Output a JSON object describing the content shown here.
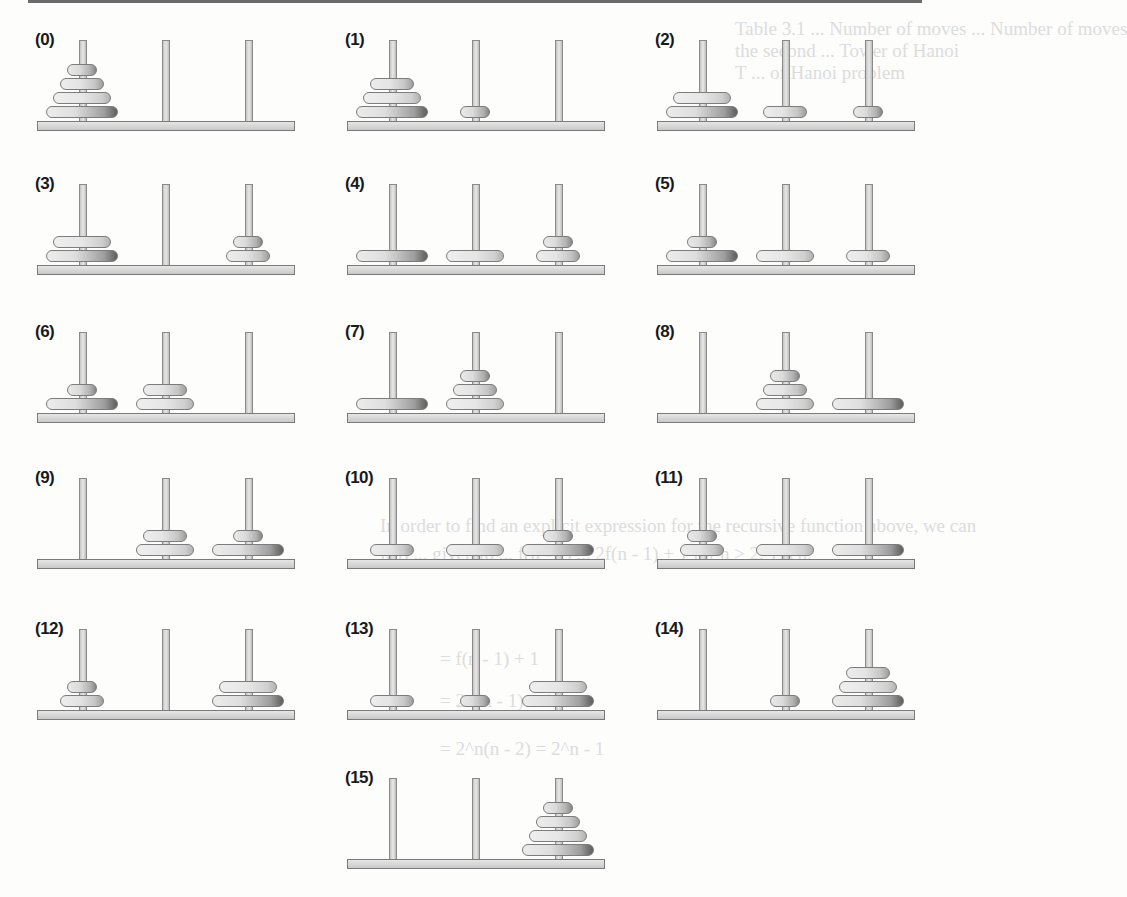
{
  "figure": {
    "pegs": [
      "A",
      "B",
      "C"
    ],
    "disk_sizes": [
      1,
      2,
      3,
      4
    ],
    "panels": [
      {
        "label": "(0)",
        "pegs": [
          [
            4,
            3,
            2,
            1
          ],
          [],
          []
        ]
      },
      {
        "label": "(1)",
        "pegs": [
          [
            4,
            3,
            2
          ],
          [
            1
          ],
          []
        ]
      },
      {
        "label": "(2)",
        "pegs": [
          [
            4,
            3
          ],
          [
            2
          ],
          [
            1
          ]
        ]
      },
      {
        "label": "(3)",
        "pegs": [
          [
            4,
            3
          ],
          [],
          [
            2,
            1
          ]
        ]
      },
      {
        "label": "(4)",
        "pegs": [
          [
            4
          ],
          [
            3
          ],
          [
            2,
            1
          ]
        ]
      },
      {
        "label": "(5)",
        "pegs": [
          [
            4,
            1
          ],
          [
            3
          ],
          [
            2
          ]
        ]
      },
      {
        "label": "(6)",
        "pegs": [
          [
            4,
            1
          ],
          [
            3,
            2
          ],
          []
        ]
      },
      {
        "label": "(7)",
        "pegs": [
          [
            4
          ],
          [
            3,
            2,
            1
          ],
          []
        ]
      },
      {
        "label": "(8)",
        "pegs": [
          [],
          [
            3,
            2,
            1
          ],
          [
            4
          ]
        ]
      },
      {
        "label": "(9)",
        "pegs": [
          [],
          [
            3,
            2
          ],
          [
            4,
            1
          ]
        ]
      },
      {
        "label": "(10)",
        "pegs": [
          [
            2
          ],
          [
            3
          ],
          [
            4,
            1
          ]
        ]
      },
      {
        "label": "(11)",
        "pegs": [
          [
            2,
            1
          ],
          [
            3
          ],
          [
            4
          ]
        ]
      },
      {
        "label": "(12)",
        "pegs": [
          [
            2,
            1
          ],
          [],
          [
            4,
            3
          ]
        ]
      },
      {
        "label": "(13)",
        "pegs": [
          [
            2
          ],
          [
            1
          ],
          [
            4,
            3
          ]
        ]
      },
      {
        "label": "(14)",
        "pegs": [
          [],
          [
            1
          ],
          [
            4,
            3,
            2
          ]
        ]
      },
      {
        "label": "(15)",
        "pegs": [
          [],
          [],
          [
            4,
            3,
            2,
            1
          ]
        ]
      }
    ]
  },
  "bleed_through": {
    "lines": [
      {
        "text": "Table 3.1  ...  Number of moves  ...  Number of moves",
        "x": 735,
        "y": 18
      },
      {
        "text": "the second  ...  Tower of Hanoi",
        "x": 735,
        "y": 40
      },
      {
        "text": "T ... of Hanoi problem",
        "x": 735,
        "y": 62
      },
      {
        "text": "In order to find an explicit expression for the recursive function above, we can",
        "x": 380,
        "y": 515
      },
      {
        "text": "f(n) ... given to ... f(n - 1) ... 2f(n - 1) + 1 for n ≥ 2. Then,",
        "x": 380,
        "y": 543
      },
      {
        "text": "= f(n - 1) + 1",
        "x": 440,
        "y": 648
      },
      {
        "text": "= 2 f(n - 1) + 1",
        "x": 440,
        "y": 690
      },
      {
        "text": "= 2^n(n - 2) = 2^n - 1",
        "x": 440,
        "y": 738
      }
    ]
  }
}
